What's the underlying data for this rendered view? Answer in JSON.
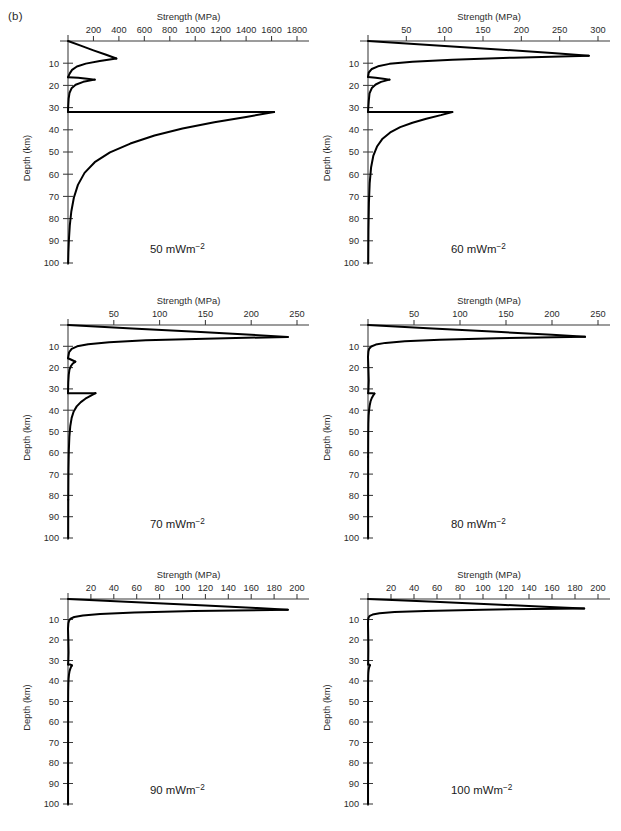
{
  "figure": {
    "panel_letter": "(b)",
    "axis_title": "Strength (MPa)",
    "y_axis_label": "Depth (km)",
    "depth_ticks": [
      10,
      20,
      30,
      40,
      50,
      60,
      70,
      80,
      90,
      100
    ],
    "depth_range": [
      0,
      100
    ],
    "line_color": "#000000",
    "axis_color": "#3a3a3a",
    "background": "#ffffff"
  },
  "chart_data": [
    {
      "type": "line",
      "title": "Strength (MPa)",
      "xlabel": "Strength (MPa)",
      "ylabel": "Depth (km)",
      "annotation": "50 mWm",
      "annotation_sup": "−2",
      "heat_flow_mW_m2": 50,
      "xlim": [
        0,
        1800
      ],
      "ylim": [
        100,
        0
      ],
      "xticks": [
        200,
        400,
        600,
        800,
        1000,
        1200,
        1400,
        1600,
        1800
      ],
      "grid": false,
      "legend": "none",
      "series": [
        {
          "name": "upper-crust-brittle",
          "x": [
            0,
            100,
            200,
            300,
            380
          ],
          "y": [
            0,
            2.1,
            4.2,
            6.2,
            7.9
          ]
        },
        {
          "name": "upper-crust-ductile",
          "x": [
            380,
            250,
            140,
            70,
            32,
            14,
            6,
            2,
            0
          ],
          "y": [
            7.9,
            9.0,
            10.2,
            11.5,
            13.0,
            14.6,
            15.6,
            16.1,
            16.3
          ]
        },
        {
          "name": "lower-crust-brittle",
          "x": [
            0,
            80,
            150,
            210
          ],
          "y": [
            16.3,
            16.6,
            17.0,
            17.4
          ]
        },
        {
          "name": "lower-crust-ductile",
          "x": [
            210,
            120,
            60,
            28,
            12,
            5,
            1,
            0
          ],
          "y": [
            17.4,
            18.4,
            19.7,
            21.3,
            23.4,
            26.0,
            30.0,
            32.0
          ]
        },
        {
          "name": "mantle-brittle",
          "x": [
            0,
            400,
            900,
            1400,
            1620
          ],
          "y": [
            32.0,
            32.0,
            32.0,
            32.0,
            32.0
          ]
        },
        {
          "name": "mantle-ductile",
          "x": [
            1620,
            1400,
            1150,
            900,
            680,
            490,
            330,
            210,
            130,
            78,
            46,
            26,
            14,
            7,
            3,
            1
          ],
          "y": [
            32.0,
            34.2,
            36.6,
            39.4,
            42.6,
            46.2,
            50.2,
            54.6,
            59.4,
            64.8,
            70.6,
            76.8,
            83.2,
            89.6,
            95.4,
            100.0
          ]
        }
      ]
    },
    {
      "type": "line",
      "title": "Strength (MPa)",
      "xlabel": "Strength (MPa)",
      "ylabel": "Depth (km)",
      "annotation": "60 mWm",
      "annotation_sup": "−2",
      "heat_flow_mW_m2": 60,
      "xlim": [
        0,
        300
      ],
      "ylim": [
        100,
        0
      ],
      "xticks": [
        50,
        100,
        150,
        200,
        250,
        300
      ],
      "grid": false,
      "legend": "none",
      "series": [
        {
          "name": "upper-crust-brittle",
          "x": [
            0,
            80,
            160,
            240,
            288
          ],
          "y": [
            0,
            1.8,
            3.6,
            5.4,
            6.6
          ]
        },
        {
          "name": "upper-crust-ductile",
          "x": [
            288,
            190,
            110,
            58,
            28,
            13,
            5,
            1,
            0
          ],
          "y": [
            6.6,
            7.5,
            8.4,
            9.3,
            10.3,
            11.4,
            12.6,
            14.2,
            16.2
          ]
        },
        {
          "name": "lower-crust-brittle",
          "x": [
            0,
            10,
            20,
            28
          ],
          "y": [
            16.2,
            16.6,
            17.0,
            17.4
          ]
        },
        {
          "name": "lower-crust-ductile",
          "x": [
            28,
            17,
            10,
            5,
            2,
            1,
            0
          ],
          "y": [
            17.4,
            18.4,
            19.6,
            21.2,
            23.6,
            27.0,
            32.0
          ]
        },
        {
          "name": "mantle-brittle",
          "x": [
            0,
            40,
            80,
            110
          ],
          "y": [
            32.0,
            32.0,
            32.0,
            32.0
          ]
        },
        {
          "name": "mantle-ductile",
          "x": [
            110,
            95,
            76,
            58,
            42,
            29,
            19,
            12,
            7,
            4,
            2.2,
            1.2,
            0.6,
            0.3
          ],
          "y": [
            32.0,
            33.4,
            35.0,
            36.8,
            38.8,
            41.2,
            44.0,
            47.4,
            51.6,
            57.0,
            64.0,
            73.0,
            85.0,
            100.0
          ]
        }
      ]
    },
    {
      "type": "line",
      "title": "Strength (MPa)",
      "xlabel": "Strength (MPa)",
      "ylabel": "Depth (km)",
      "annotation": "70 mWm",
      "annotation_sup": "−2",
      "heat_flow_mW_m2": 70,
      "xlim": [
        0,
        250
      ],
      "ylim": [
        100,
        0
      ],
      "xticks": [
        50,
        100,
        150,
        200,
        250
      ],
      "grid": false,
      "legend": "none",
      "series": [
        {
          "name": "upper-crust-brittle",
          "x": [
            0,
            70,
            140,
            200,
            240
          ],
          "y": [
            0,
            1.6,
            3.2,
            4.6,
            5.6
          ]
        },
        {
          "name": "upper-crust-ductile",
          "x": [
            240,
            150,
            85,
            45,
            22,
            10,
            4,
            1.2,
            0
          ],
          "y": [
            5.6,
            6.4,
            7.2,
            8.1,
            9.0,
            10.0,
            11.2,
            12.8,
            15.6
          ]
        },
        {
          "name": "lower-crust-brittle",
          "x": [
            0,
            3,
            6,
            8
          ],
          "y": [
            15.6,
            16.2,
            16.8,
            17.2
          ]
        },
        {
          "name": "lower-crust-ductile",
          "x": [
            8,
            5,
            3,
            1.6,
            0.8,
            0.3,
            0
          ],
          "y": [
            17.2,
            18.2,
            19.4,
            21.0,
            23.4,
            27.0,
            32.0
          ]
        },
        {
          "name": "mantle-brittle",
          "x": [
            0,
            12,
            22,
            30
          ],
          "y": [
            32.0,
            32.0,
            32.0,
            32.0
          ]
        },
        {
          "name": "mantle-ductile",
          "x": [
            30,
            25,
            19,
            14,
            9.5,
            6.2,
            4.0,
            2.5,
            1.5,
            0.9,
            0.5,
            0.3
          ],
          "y": [
            32.0,
            33.2,
            34.6,
            36.2,
            38.2,
            40.6,
            43.6,
            47.4,
            52.4,
            59.0,
            68.0,
            82.0
          ]
        },
        {
          "name": "mantle-tail",
          "x": [
            0.3,
            0.2
          ],
          "y": [
            82.0,
            100.0
          ]
        }
      ]
    },
    {
      "type": "line",
      "title": "Strength (MPa)",
      "xlabel": "Strength (MPa)",
      "ylabel": "Depth (km)",
      "annotation": "80 mWm",
      "annotation_sup": "−2",
      "heat_flow_mW_m2": 80,
      "xlim": [
        0,
        250
      ],
      "ylim": [
        100,
        0
      ],
      "xticks": [
        50,
        100,
        150,
        200,
        250
      ],
      "grid": false,
      "legend": "none",
      "series": [
        {
          "name": "upper-crust-brittle",
          "x": [
            0,
            70,
            140,
            200,
            236
          ],
          "y": [
            0,
            1.6,
            3.2,
            4.6,
            5.5
          ]
        },
        {
          "name": "upper-crust-ductile",
          "x": [
            236,
            140,
            78,
            40,
            19,
            8.5,
            3.5,
            1.2,
            0.4,
            0
          ],
          "y": [
            5.5,
            6.2,
            6.9,
            7.6,
            8.4,
            9.2,
            10.1,
            11.2,
            12.6,
            15.0
          ]
        },
        {
          "name": "lower-crust",
          "x": [
            0,
            0.4,
            0.8,
            0.5,
            0.2
          ],
          "y": [
            15.0,
            20.0,
            26.0,
            30.0,
            32.0
          ]
        },
        {
          "name": "mantle-brittle-notch",
          "x": [
            0.2,
            4.5,
            7.0
          ],
          "y": [
            32.0,
            32.0,
            32.2
          ]
        },
        {
          "name": "mantle-ductile",
          "x": [
            7.0,
            5.5,
            4.0,
            2.8,
            1.9,
            1.2,
            0.7,
            0.4,
            0.25,
            0.15
          ],
          "y": [
            32.2,
            33.2,
            34.4,
            35.8,
            37.6,
            39.8,
            42.6,
            46.4,
            52.0,
            62.0
          ]
        },
        {
          "name": "mantle-tail",
          "x": [
            0.15,
            0.1
          ],
          "y": [
            62.0,
            100.0
          ]
        }
      ]
    },
    {
      "type": "line",
      "title": "Strength (MPa)",
      "xlabel": "Strength (MPa)",
      "ylabel": "Depth (km)",
      "annotation": "90 mWm",
      "annotation_sup": "−2",
      "heat_flow_mW_m2": 90,
      "xlim": [
        0,
        200
      ],
      "ylim": [
        100,
        0
      ],
      "xticks": [
        20,
        40,
        60,
        80,
        100,
        120,
        140,
        160,
        180,
        200
      ],
      "grid": false,
      "legend": "none",
      "series": [
        {
          "name": "upper-crust-brittle",
          "x": [
            0,
            60,
            120,
            165,
            192
          ],
          "y": [
            0,
            1.6,
            3.2,
            4.4,
            5.2
          ]
        },
        {
          "name": "upper-crust-ductile",
          "x": [
            192,
            110,
            58,
            28,
            13,
            5.5,
            2.2,
            0.9,
            0.3,
            0
          ],
          "y": [
            5.2,
            5.9,
            6.6,
            7.3,
            8.0,
            8.8,
            9.6,
            10.6,
            12.0,
            14.5
          ]
        },
        {
          "name": "lower-crust",
          "x": [
            0,
            0.3,
            0.5,
            0.3,
            0.1
          ],
          "y": [
            14.5,
            20.0,
            26.0,
            30.0,
            32.0
          ]
        },
        {
          "name": "mantle-brittle-notch",
          "x": [
            0.1,
            2.2,
            3.4
          ],
          "y": [
            32.0,
            32.0,
            32.4
          ]
        },
        {
          "name": "mantle-ductile",
          "x": [
            3.4,
            2.6,
            1.9,
            1.3,
            0.85,
            0.52,
            0.3,
            0.17,
            0.1
          ],
          "y": [
            32.4,
            33.2,
            34.2,
            35.4,
            36.9,
            38.8,
            41.4,
            45.0,
            50.0
          ]
        },
        {
          "name": "mantle-tail",
          "x": [
            0.1,
            0.05
          ],
          "y": [
            50.0,
            100.0
          ]
        }
      ]
    },
    {
      "type": "line",
      "title": "Strength (MPa)",
      "xlabel": "Strength (MPa)",
      "ylabel": "Depth (km)",
      "annotation": "100 mWm",
      "annotation_sup": "−2",
      "heat_flow_mW_m2": 100,
      "xlim": [
        0,
        200
      ],
      "ylim": [
        100,
        0
      ],
      "xticks": [
        20,
        40,
        60,
        80,
        100,
        120,
        140,
        160,
        180,
        200
      ],
      "grid": false,
      "legend": "none",
      "series": [
        {
          "name": "upper-crust-brittle",
          "x": [
            0,
            58,
            115,
            158,
            188
          ],
          "y": [
            0,
            1.4,
            2.8,
            3.9,
            4.6
          ]
        },
        {
          "name": "upper-crust-ductile",
          "x": [
            188,
            100,
            50,
            23,
            10,
            4.0,
            1.5,
            0.5,
            0.15,
            0
          ],
          "y": [
            4.6,
            5.2,
            5.8,
            6.4,
            7.0,
            7.6,
            8.2,
            9.0,
            10.0,
            12.0
          ]
        },
        {
          "name": "lower-crust",
          "x": [
            0,
            0.2,
            0.3,
            0.2,
            0.08
          ],
          "y": [
            12.0,
            18.0,
            25.0,
            30.0,
            32.0
          ]
        },
        {
          "name": "mantle-brittle-notch",
          "x": [
            0.08,
            1.1,
            1.7
          ],
          "y": [
            32.0,
            32.0,
            32.3
          ]
        },
        {
          "name": "mantle-ductile",
          "x": [
            1.7,
            1.2,
            0.8,
            0.5,
            0.3,
            0.18,
            0.1,
            0.05
          ],
          "y": [
            32.3,
            33.0,
            33.8,
            34.8,
            36.0,
            37.6,
            40.0,
            44.0
          ]
        },
        {
          "name": "mantle-tail",
          "x": [
            0.05,
            0.03
          ],
          "y": [
            44.0,
            100.0
          ]
        }
      ]
    }
  ]
}
